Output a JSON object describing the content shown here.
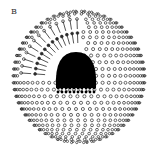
{
  "figure": {
    "panel_label": "B",
    "colors": {
      "background": "#ffffff",
      "ink": "#2a2a2a",
      "core": "#000000"
    },
    "sphere": {
      "cx": 79,
      "cy": 77,
      "r": 66
    },
    "cutaway": {
      "start_deg": 180,
      "end_deg": 275
    },
    "inner_layer": {
      "r": 44
    },
    "core": {
      "cx": 76,
      "cy": 70,
      "rx": 20,
      "ry": 18
    }
  }
}
